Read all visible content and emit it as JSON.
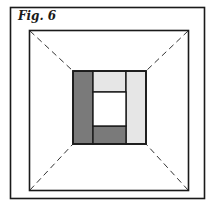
{
  "figure": {
    "label": "Fig. 6",
    "colors": {
      "stroke": "#1a1a1a",
      "dark_fill": "#7a7a7a",
      "light_fill": "#e6e6e6",
      "white_fill": "#ffffff"
    },
    "outer_frame": {
      "x": 10,
      "y": 7,
      "w": 195,
      "h": 192
    },
    "room_frame": {
      "x": 29,
      "y": 30,
      "w": 160,
      "h": 161
    },
    "center_block": {
      "x": 73,
      "y": 71,
      "w": 73,
      "h": 73,
      "pieces": [
        {
          "name": "left-strip",
          "shade": "dark"
        },
        {
          "name": "top-strip",
          "shade": "light"
        },
        {
          "name": "right-strip",
          "shade": "light"
        },
        {
          "name": "bottom-strip",
          "shade": "dark"
        },
        {
          "name": "center-opening",
          "shade": "white"
        }
      ]
    },
    "perspective_lines": "dashed diagonals from room corners to center block corners"
  }
}
